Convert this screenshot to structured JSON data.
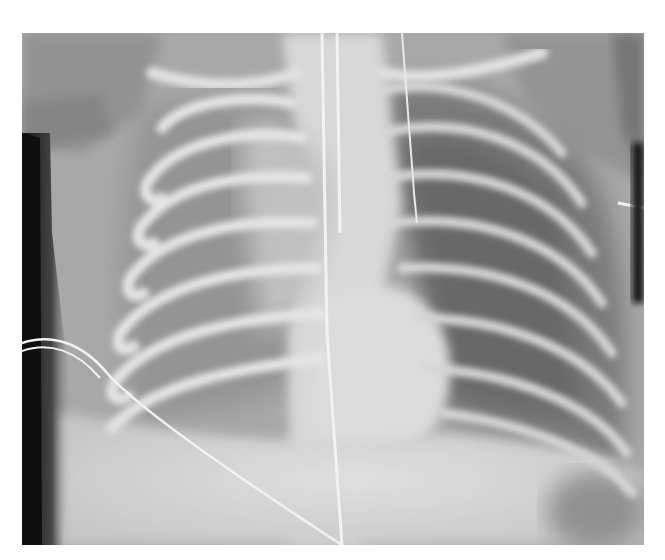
{
  "image": {
    "type": "radiograph",
    "subject": "pediatric chest x-ray, frontal view",
    "frame": {
      "x": 22,
      "y": 33,
      "width": 622,
      "height": 512
    },
    "palette": {
      "background": "#ffffff",
      "soft_tissue": "#a4a4a4",
      "bone": "#e6e6e6",
      "lung_left_view": "#8e8e8e",
      "lung_right_view": "#6a6a6a",
      "air_outside": "#0a0a0a",
      "mediastinum": "#dcdcdc"
    },
    "visible_text": []
  }
}
